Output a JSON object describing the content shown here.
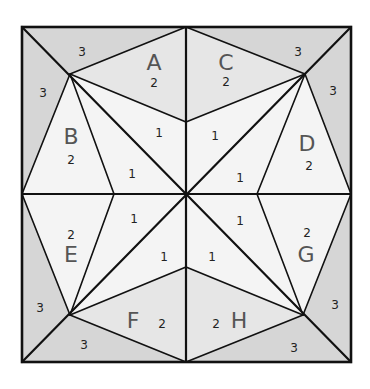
{
  "diagram": {
    "colors": {
      "shade_3": "#d6d6d6",
      "shade_2": "#e6e6e6",
      "shade_1": "#f4f4f4",
      "line": "#111111",
      "letter": "#555555",
      "number": "#222222"
    },
    "sections": [
      {
        "letter": "A",
        "number": "2"
      },
      {
        "letter": "B",
        "number": "2"
      },
      {
        "letter": "C",
        "number": "2"
      },
      {
        "letter": "D",
        "number": "2"
      },
      {
        "letter": "E",
        "number": "2"
      },
      {
        "letter": "F",
        "number": "2"
      },
      {
        "letter": "G",
        "number": "2"
      },
      {
        "letter": "H",
        "number": "2"
      }
    ],
    "corner_numbers": {
      "tl_top": "3",
      "tl_left": "3",
      "tr_top": "3",
      "tr_right": "3",
      "bl_left": "3",
      "bl_bottom": "3",
      "br_right": "3",
      "br_bottom": "3"
    },
    "center_numbers": {
      "nnw": "1",
      "wnw": "1",
      "nne": "1",
      "ene": "1",
      "wsw": "1",
      "ssw": "1",
      "ese": "1",
      "sse": "1"
    }
  }
}
